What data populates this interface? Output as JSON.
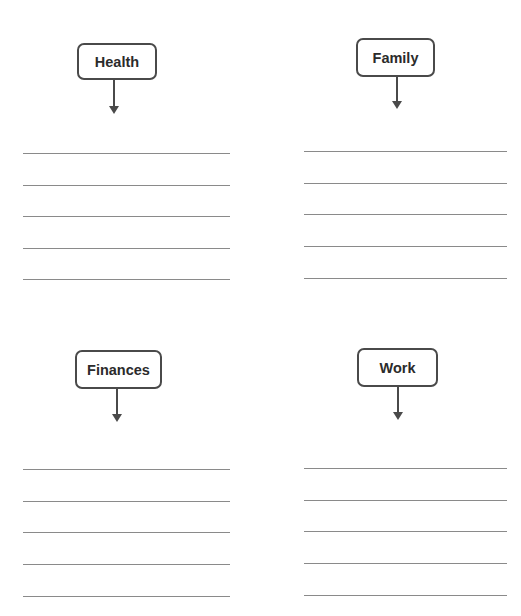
{
  "categories": [
    {
      "id": "health",
      "label": "Health",
      "lines": 5
    },
    {
      "id": "family",
      "label": "Family",
      "lines": 5
    },
    {
      "id": "finances",
      "label": "Finances",
      "lines": 5
    },
    {
      "id": "work",
      "label": "Work",
      "lines": 5
    }
  ],
  "colors": {
    "border": "#4a4a4a",
    "text": "#2b2b2b",
    "line": "#8a8a8a"
  }
}
